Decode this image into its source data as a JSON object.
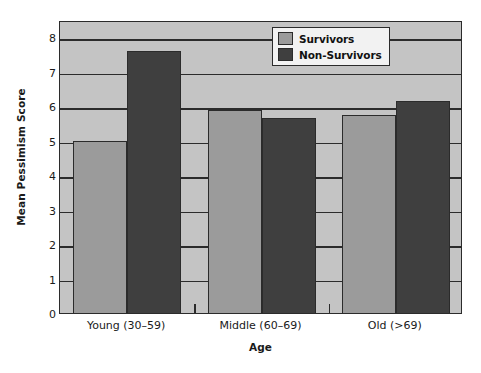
{
  "chart_data": {
    "type": "bar",
    "title": "",
    "subtitle": "",
    "xlabel": "Age",
    "ylabel": "Mean Pessimism Score",
    "categories": [
      "Young (30–59)",
      "Middle (60–69)",
      "Old (>69)"
    ],
    "series": [
      {
        "name": "Survivors",
        "values": [
          5.0,
          5.9,
          5.75
        ],
        "color": "#9b9b9b"
      },
      {
        "name": "Non-Survivors",
        "values": [
          7.6,
          5.65,
          6.15
        ],
        "color": "#3f3f3f"
      }
    ],
    "ylim": [
      0,
      8.5
    ],
    "yticks": [
      0,
      1,
      2,
      3,
      4,
      5,
      6,
      7,
      8
    ],
    "ytick_labels": [
      "0",
      "1",
      "2",
      "3",
      "4",
      "5",
      "6",
      "7",
      "8"
    ],
    "grid": "horizontal",
    "legend_position": "top-right",
    "plot_background": "#c4c4c4",
    "axis_color": "#2b2b2b",
    "figure_background": "#ffffff",
    "annotations": []
  },
  "legend": {
    "items": [
      {
        "label": "Survivors",
        "swatch": "survivors"
      },
      {
        "label": "Non-Survivors",
        "swatch": "nonsurvivors"
      }
    ]
  }
}
